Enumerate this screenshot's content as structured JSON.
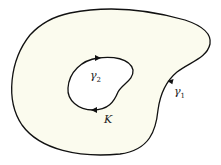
{
  "diagram": {
    "region_label": "K",
    "outer_curve": {
      "label_base": "γ",
      "label_sub": "1"
    },
    "inner_curve": {
      "label_base": "γ",
      "label_sub": "2"
    },
    "colors": {
      "fill": "#fbfbee",
      "stroke": "#111111",
      "hole": "#ffffff"
    }
  }
}
